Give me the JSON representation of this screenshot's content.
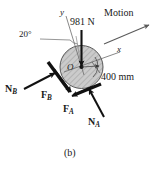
{
  "figure": {
    "caption": "(b)",
    "background_color": "#ffffff",
    "ink_color": "#1a1a1a"
  },
  "body": {
    "shape": "disk",
    "center_label": "O",
    "fill_color": "#c9c9c9",
    "hatch_color": "#8a8a8a",
    "edge_color": "#3a3a3a",
    "diameter_label": "400 mm"
  },
  "axes": {
    "x_label": "x",
    "y_label": "y",
    "tilt_label": "20°",
    "tilt_degrees": 20
  },
  "motion": {
    "label": "Motion"
  },
  "forces": [
    {
      "name": "weight",
      "label_main": "981 N",
      "label_sub": "",
      "direction": "down"
    },
    {
      "name": "normal-b",
      "label_main": "N",
      "label_sub": "B",
      "direction": "up-right"
    },
    {
      "name": "friction-b",
      "label_main": "F",
      "label_sub": "B",
      "direction": "down-right"
    },
    {
      "name": "friction-a",
      "label_main": "F",
      "label_sub": "A",
      "direction": "down-left"
    },
    {
      "name": "normal-a",
      "label_main": "N",
      "label_sub": "A",
      "direction": "up-left"
    }
  ]
}
